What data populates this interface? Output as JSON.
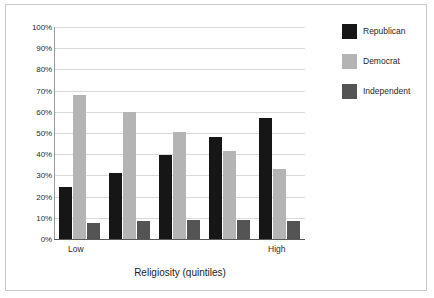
{
  "chart_data": {
    "type": "bar",
    "title": "",
    "subtitle": "",
    "xlabel": "Religiosity (quintiles)",
    "ylabel": "",
    "categories": [
      "1",
      "2",
      "3",
      "4",
      "5"
    ],
    "category_endpoint_labels": {
      "first": "Low",
      "last": "High"
    },
    "ylim": [
      0,
      100
    ],
    "y_tick_labels": [
      "0%",
      "10%",
      "20%",
      "30%",
      "40%",
      "50%",
      "60%",
      "70%",
      "80%",
      "90%",
      "100%"
    ],
    "y_tick_values": [
      0,
      10,
      20,
      30,
      40,
      50,
      60,
      70,
      80,
      90,
      100
    ],
    "grid": "horizontal",
    "legend_position": "right",
    "value_unit": "%",
    "series": [
      {
        "name": "Republican",
        "color": "#161616",
        "values": [
          24.5,
          31.0,
          39.5,
          48.0,
          57.0
        ]
      },
      {
        "name": "Democrat",
        "color": "#b4b4b4",
        "values": [
          68.0,
          60.0,
          50.5,
          41.5,
          33.0
        ]
      },
      {
        "name": "Independent",
        "color": "#545454",
        "values": [
          7.5,
          8.5,
          9.0,
          9.0,
          8.5
        ]
      }
    ]
  },
  "axis": {
    "x_title": "Religiosity (quintiles)",
    "low_label": "Low",
    "high_label": "High"
  },
  "legend": {
    "items": [
      {
        "label": "Republican",
        "color": "#161616"
      },
      {
        "label": "Democrat",
        "color": "#b4b4b4"
      },
      {
        "label": "Independent",
        "color": "#545454"
      }
    ]
  }
}
